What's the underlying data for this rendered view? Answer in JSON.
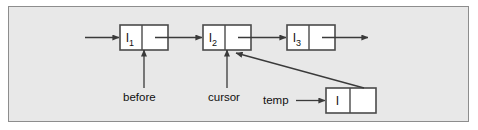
{
  "figure": {
    "background_color": "#e8e8e8",
    "frame_border_color": "#8d8d8d",
    "line_color": "#3a3a3a",
    "node_fill_color": "#ffffff",
    "node_border_color": "#4a4a4a",
    "text_color": "#101010"
  },
  "nodes": [
    {
      "id": "node-1",
      "value": "l",
      "subscript": "1",
      "x": 120,
      "y": 25,
      "width": 48,
      "height": 25,
      "split": 22
    },
    {
      "id": "node-2",
      "value": "l",
      "subscript": "2",
      "x": 203,
      "y": 25,
      "width": 48,
      "height": 25,
      "split": 22
    },
    {
      "id": "node-3",
      "value": "l",
      "subscript": "3",
      "x": 287,
      "y": 25,
      "width": 48,
      "height": 25,
      "split": 22
    },
    {
      "id": "node-temp",
      "value": "l",
      "subscript": "",
      "x": 326,
      "y": 88,
      "width": 50,
      "height": 25,
      "split": 24
    }
  ],
  "pointer_labels": [
    {
      "id": "before",
      "text": "before",
      "x": 144,
      "y": 97
    },
    {
      "id": "cursor",
      "text": "cursor",
      "x": 227,
      "y": 97
    },
    {
      "id": "temp",
      "text": "temp",
      "x": 283,
      "y": 100
    }
  ],
  "edges": [
    {
      "id": "head-arrow",
      "from": "list-head",
      "to": "node-1"
    },
    {
      "id": "link-1-2",
      "from": "node-1",
      "to": "node-2"
    },
    {
      "id": "link-2-3",
      "from": "node-2",
      "to": "node-3"
    },
    {
      "id": "link-3-tail",
      "from": "node-3",
      "to": "list-tail"
    },
    {
      "id": "before-arrow",
      "from": "before",
      "to": "node-1"
    },
    {
      "id": "cursor-arrow",
      "from": "cursor",
      "to": "node-2"
    },
    {
      "id": "temp-arrow",
      "from": "temp",
      "to": "node-temp"
    },
    {
      "id": "temp-next-arrow",
      "from": "node-temp",
      "to": "node-2"
    }
  ]
}
